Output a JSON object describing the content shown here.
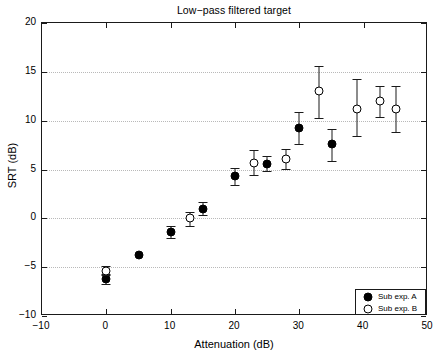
{
  "chart_data": {
    "type": "scatter",
    "title": "Low−pass filtered target",
    "xlabel": "Attenuation (dB)",
    "ylabel": "SRT (dB)",
    "xlim": [
      -10,
      50
    ],
    "ylim": [
      -10,
      20
    ],
    "xticks": [
      -10,
      0,
      10,
      20,
      30,
      40,
      50
    ],
    "xticklabels": [
      "−10",
      "0",
      "10",
      "20",
      "30",
      "40",
      "50"
    ],
    "yticks": [
      -10,
      -5,
      0,
      5,
      10,
      15,
      20
    ],
    "yticklabels": [
      "−10",
      "−5",
      "0",
      "5",
      "10",
      "15",
      "20"
    ],
    "grid": "horizontal-dotted",
    "legend_position": "lower-right",
    "series": [
      {
        "name": "Sub exp. A",
        "marker": "filled-circle",
        "color": "#000000",
        "points": [
          {
            "x": 0,
            "y": -6.2,
            "yerr_low": -6.7,
            "yerr_high": -5.7
          },
          {
            "x": 5,
            "y": -3.8,
            "yerr_low": -3.8,
            "yerr_high": -3.8
          },
          {
            "x": 10,
            "y": -1.4,
            "yerr_low": -2.0,
            "yerr_high": -0.8
          },
          {
            "x": 15,
            "y": 1.0,
            "yerr_low": 0.3,
            "yerr_high": 1.7
          },
          {
            "x": 20,
            "y": 4.3,
            "yerr_low": 3.4,
            "yerr_high": 5.2
          },
          {
            "x": 25,
            "y": 5.6,
            "yerr_low": 4.8,
            "yerr_high": 6.4
          },
          {
            "x": 30,
            "y": 9.3,
            "yerr_low": 7.6,
            "yerr_high": 10.9
          },
          {
            "x": 35,
            "y": 7.6,
            "yerr_low": 5.9,
            "yerr_high": 9.1
          }
        ]
      },
      {
        "name": "Sub exp. B",
        "marker": "open-circle",
        "color": "#000000",
        "points": [
          {
            "x": 0,
            "y": -5.4,
            "yerr_low": -5.8,
            "yerr_high": -4.9
          },
          {
            "x": 13,
            "y": 0.0,
            "yerr_low": -0.8,
            "yerr_high": 0.6
          },
          {
            "x": 23,
            "y": 5.7,
            "yerr_low": 4.4,
            "yerr_high": 7.0
          },
          {
            "x": 28,
            "y": 6.1,
            "yerr_low": 5.1,
            "yerr_high": 7.1
          },
          {
            "x": 33,
            "y": 13.0,
            "yerr_low": 10.3,
            "yerr_high": 15.6
          },
          {
            "x": 39,
            "y": 11.2,
            "yerr_low": 8.4,
            "yerr_high": 14.3
          },
          {
            "x": 42.5,
            "y": 12.0,
            "yerr_low": 10.4,
            "yerr_high": 13.5
          },
          {
            "x": 45,
            "y": 11.2,
            "yerr_low": 8.8,
            "yerr_high": 13.6
          }
        ]
      }
    ]
  },
  "legend": {
    "entries": [
      {
        "label": "Sub exp. A",
        "marker": "filled-circle"
      },
      {
        "label": "Sub exp. B",
        "marker": "open-circle"
      }
    ]
  }
}
